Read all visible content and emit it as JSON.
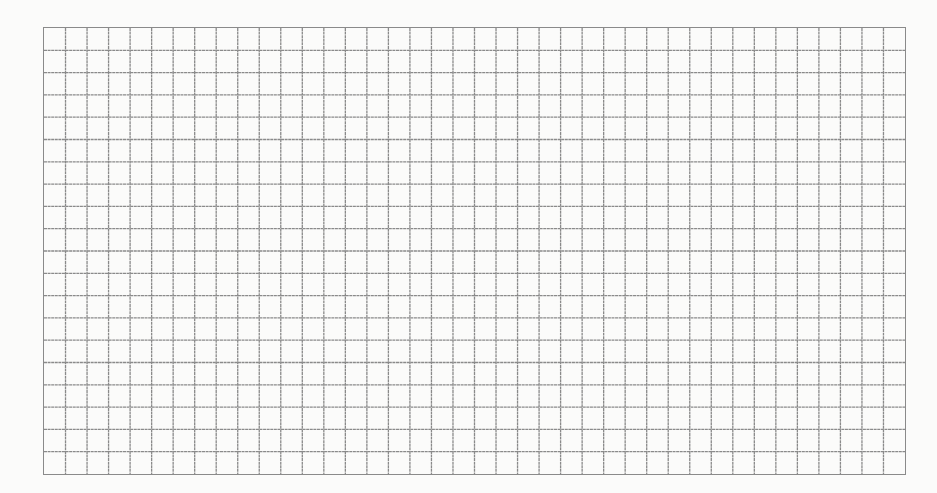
{
  "grid": {
    "columns": 40,
    "rows": 20,
    "line_color": "#8a8a8a",
    "background_color": "#fbfbfa"
  }
}
